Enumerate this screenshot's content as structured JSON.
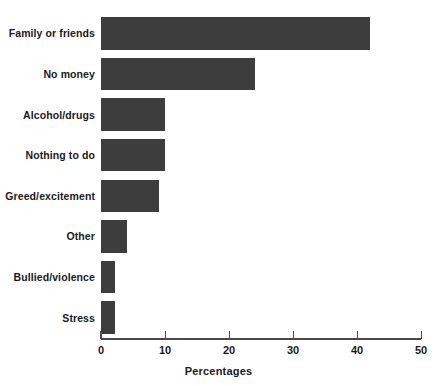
{
  "chart_data": {
    "type": "bar",
    "orientation": "horizontal",
    "title": "",
    "xlabel": "Percentages",
    "ylabel": "",
    "xlim": [
      0,
      50
    ],
    "xticks": [
      0,
      10,
      20,
      30,
      40,
      50
    ],
    "xtick_labels": [
      "0",
      "10",
      "20",
      "30",
      "40",
      "50"
    ],
    "grid": false,
    "legend": false,
    "bar_color": "#3d3d3d",
    "categories": [
      "Family or friends",
      "No money",
      "Alcohol/drugs",
      "Nothing to do",
      "Greed/excitement",
      "Other",
      "Bullied/violence",
      "Stress"
    ],
    "values": [
      42,
      24,
      10,
      10,
      9,
      4,
      2.2,
      2.2
    ]
  }
}
